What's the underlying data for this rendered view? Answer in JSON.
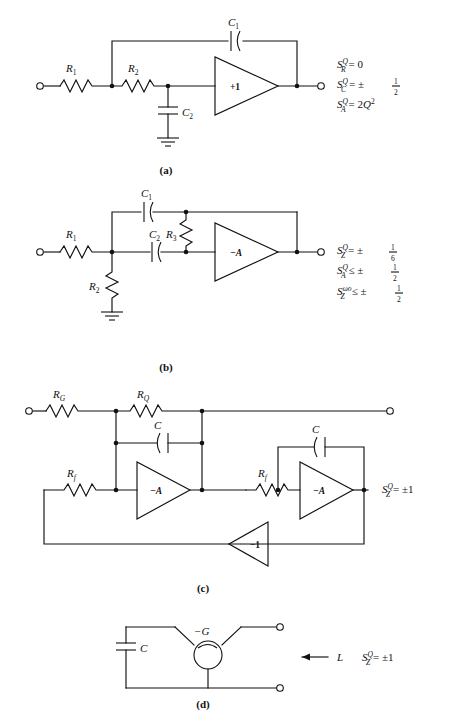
{
  "figure": {
    "background": "#ffffff",
    "ink": "#111111",
    "panels": [
      {
        "id": "a",
        "caption": "(a)",
        "amplifier_label": "+1",
        "components": [
          {
            "name": "R1",
            "base": "R",
            "sub": "1",
            "type": "resistor",
            "orientation": "horizontal"
          },
          {
            "name": "R2",
            "base": "R",
            "sub": "2",
            "type": "resistor",
            "orientation": "horizontal"
          },
          {
            "name": "C1",
            "base": "C",
            "sub": "1",
            "type": "capacitor",
            "orientation": "horizontal"
          },
          {
            "name": "C2",
            "base": "C",
            "sub": "2",
            "type": "capacitor",
            "orientation": "vertical"
          }
        ],
        "has_ground": true,
        "sensitivities": [
          {
            "base": "S",
            "sub": "R",
            "sup": "Q",
            "rel": "=",
            "value": "0"
          },
          {
            "base": "S",
            "sub": "C",
            "sup": "Q",
            "rel": "=",
            "value": "±",
            "fraction": {
              "num": "1",
              "den": "2"
            }
          },
          {
            "base": "S",
            "sub": "A",
            "sup": "Q",
            "rel": "=",
            "value": "2Q",
            "value_sup": "2"
          }
        ]
      },
      {
        "id": "b",
        "caption": "(b)",
        "amplifier_label": "−A",
        "components": [
          {
            "name": "R1",
            "base": "R",
            "sub": "1",
            "type": "resistor",
            "orientation": "horizontal"
          },
          {
            "name": "R2",
            "base": "R",
            "sub": "2",
            "type": "resistor",
            "orientation": "vertical"
          },
          {
            "name": "R3",
            "base": "R",
            "sub": "3",
            "type": "resistor",
            "orientation": "vertical"
          },
          {
            "name": "C1",
            "base": "C",
            "sub": "1",
            "type": "capacitor",
            "orientation": "horizontal"
          },
          {
            "name": "C2",
            "base": "C",
            "sub": "2",
            "type": "capacitor",
            "orientation": "horizontal"
          }
        ],
        "has_ground": true,
        "sensitivities": [
          {
            "base": "S",
            "sub": "Z",
            "sup": "Q",
            "rel": "=",
            "value": "±",
            "fraction": {
              "num": "1",
              "den": "6"
            }
          },
          {
            "base": "S",
            "sub": "A",
            "sup": "Q",
            "rel": "⩽",
            "value": "±",
            "fraction": {
              "num": "1",
              "den": "2"
            }
          },
          {
            "base": "S",
            "sub": "Z",
            "sup": "ωo",
            "rel": "⩽",
            "value": "±",
            "fraction": {
              "num": "1",
              "den": "2"
            }
          }
        ]
      },
      {
        "id": "c",
        "caption": "(c)",
        "amplifier_labels": [
          "−A",
          "−A",
          "−1"
        ],
        "components": [
          {
            "name": "RG",
            "base": "R",
            "sub": "G",
            "type": "resistor",
            "orientation": "horizontal"
          },
          {
            "name": "RQ",
            "base": "R",
            "sub": "Q",
            "type": "resistor",
            "orientation": "horizontal"
          },
          {
            "name": "Rf1",
            "base": "R",
            "sub": "f",
            "type": "resistor",
            "orientation": "horizontal"
          },
          {
            "name": "Rf2",
            "base": "R",
            "sub": "f",
            "type": "resistor",
            "orientation": "horizontal"
          },
          {
            "name": "C-left",
            "base": "C",
            "sub": "",
            "type": "capacitor",
            "orientation": "horizontal"
          },
          {
            "name": "C-right",
            "base": "C",
            "sub": "",
            "type": "capacitor",
            "orientation": "horizontal"
          }
        ],
        "has_ground": false,
        "sensitivities": [
          {
            "base": "S",
            "sub": "Z",
            "sup": "Q",
            "rel": "=",
            "value": "±1"
          }
        ]
      },
      {
        "id": "d",
        "caption": "(d)",
        "negative_conductance_label": "−G",
        "inductance_label": "L",
        "components": [
          {
            "name": "C",
            "base": "C",
            "sub": "",
            "type": "capacitor",
            "orientation": "vertical"
          }
        ],
        "has_ground": false,
        "sensitivities": [
          {
            "base": "S",
            "sub": "Z",
            "sup": "Q",
            "rel": "=",
            "value": "±1"
          }
        ]
      }
    ]
  }
}
